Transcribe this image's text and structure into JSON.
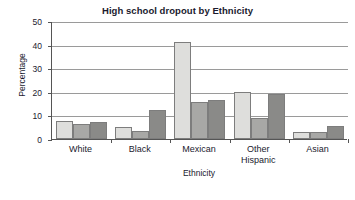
{
  "chart_data": {
    "type": "bar",
    "title": "High school dropout by Ethnicity",
    "xlabel": "Ethnicity",
    "ylabel": "Percentage",
    "categories": [
      "White",
      "Black",
      "Mexican",
      "Other Hispanic",
      "Asian"
    ],
    "ylim": [
      0,
      50
    ],
    "yticks": [
      0,
      10,
      20,
      30,
      40,
      50
    ],
    "grid": true,
    "legend": "none",
    "series": [
      {
        "name": "series-1",
        "color": "#dededc",
        "values": [
          7.5,
          5.0,
          41.3,
          20.0,
          3.0
        ]
      },
      {
        "name": "series-2",
        "color": "#a8a8a6",
        "values": [
          6.4,
          3.4,
          15.5,
          9.0,
          3.1
        ]
      },
      {
        "name": "series-3",
        "color": "#8a8a88",
        "values": [
          7.2,
          12.1,
          16.4,
          18.9,
          5.7
        ]
      }
    ]
  },
  "axis": {
    "ytick_labels": [
      "0",
      "10",
      "20",
      "30",
      "40",
      "50"
    ],
    "xtick_labels": [
      "White",
      "Black",
      "Mexican",
      "Other\nHispanic",
      "Asian"
    ]
  }
}
